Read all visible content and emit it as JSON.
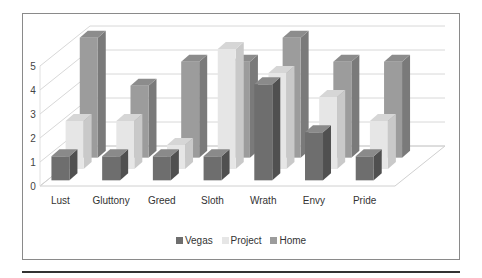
{
  "chart_data": {
    "type": "bar",
    "subtype": "3d-clustered-column",
    "title": "",
    "xlabel": "",
    "ylabel": "",
    "categories": [
      "Lust",
      "Gluttony",
      "Greed",
      "Sloth",
      "Wrath",
      "Envy",
      "Pride"
    ],
    "series": [
      {
        "name": "Vegas",
        "values": [
          1,
          1,
          1,
          1,
          4,
          2,
          1
        ],
        "color": "#6e6e6e",
        "side": "#505050",
        "top": "#8a8a8a"
      },
      {
        "name": "Project",
        "values": [
          2,
          2,
          1,
          5,
          4,
          3,
          2
        ],
        "color": "#e6e6e6",
        "side": "#c9c9c9",
        "top": "#d6d6d6"
      },
      {
        "name": "Home",
        "values": [
          5,
          3,
          4,
          4,
          5,
          4,
          4
        ],
        "color": "#9c9c9c",
        "side": "#7a7a7a",
        "top": "#8c8c8c"
      }
    ],
    "yticks": [
      0,
      1,
      2,
      3,
      4,
      5
    ],
    "ylim": [
      0,
      5
    ],
    "grid": true,
    "legend_position": "bottom"
  },
  "legend": {
    "items": [
      {
        "label": "Vegas",
        "color": "#6e6e6e"
      },
      {
        "label": "Project",
        "color": "#e6e6e6"
      },
      {
        "label": "Home",
        "color": "#9c9c9c"
      }
    ]
  }
}
